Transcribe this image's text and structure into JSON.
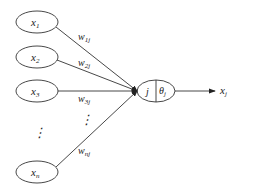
{
  "diagram": {
    "type": "artificial-neuron",
    "inputs": [
      {
        "base": "x",
        "sub": "1",
        "weight_base": "w",
        "weight_sub": "1j"
      },
      {
        "base": "x",
        "sub": "2",
        "weight_base": "w",
        "weight_sub": "2j"
      },
      {
        "base": "x",
        "sub": "3",
        "weight_base": "w",
        "weight_sub": "3j"
      },
      {
        "base": "x",
        "sub": "n",
        "weight_base": "w",
        "weight_sub": "nj"
      }
    ],
    "ellipsis_symbol": "⋮",
    "neuron": {
      "index_label": "j",
      "threshold_base": "θ",
      "threshold_sub": "j"
    },
    "output": {
      "base": "x",
      "sub": "j"
    },
    "colors": {
      "stroke": "#333333",
      "background": "#ffffff"
    }
  }
}
